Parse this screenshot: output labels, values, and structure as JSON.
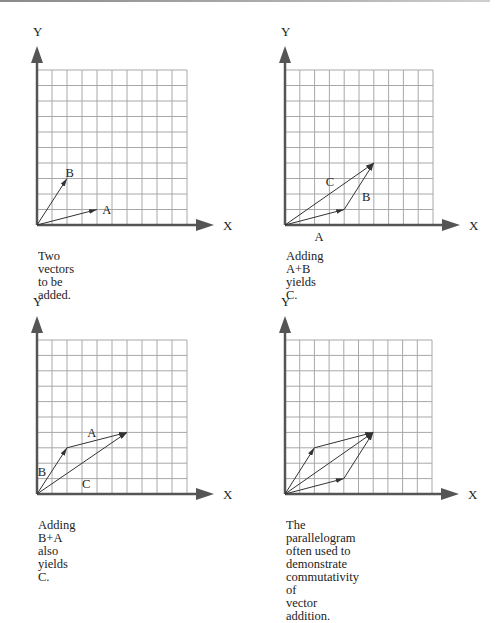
{
  "figure": {
    "grid": {
      "cols": 10,
      "rows": 10
    },
    "colors": {
      "grid": "#a8a8a8",
      "axis": "#555555",
      "vector": "#333333",
      "text": "#222222"
    },
    "axis_labels": {
      "x": "X",
      "y": "Y"
    },
    "panels": [
      {
        "id": "p1",
        "caption": "Two vectors to be added.",
        "vectors": [
          {
            "name": "A",
            "from": [
              0,
              0
            ],
            "to": [
              4,
              1
            ],
            "label": "A",
            "label_pos": [
              4.35,
              1.0
            ]
          },
          {
            "name": "B",
            "from": [
              0,
              0
            ],
            "to": [
              2,
              3
            ],
            "label": "B",
            "label_pos": [
              1.9,
              3.35
            ]
          }
        ]
      },
      {
        "id": "p2",
        "caption": "Adding A+B yields C.",
        "vectors": [
          {
            "name": "A",
            "from": [
              0,
              0
            ],
            "to": [
              4,
              1
            ],
            "label": "A",
            "label_pos": [
              2.0,
              -0.75
            ]
          },
          {
            "name": "B",
            "from": [
              4,
              1
            ],
            "to": [
              6,
              4
            ],
            "label": "B",
            "label_pos": [
              5.2,
              1.8
            ]
          },
          {
            "name": "C",
            "from": [
              0,
              0
            ],
            "to": [
              6,
              4
            ],
            "label": "C",
            "label_pos": [
              2.75,
              2.8
            ]
          }
        ]
      },
      {
        "id": "p3",
        "caption": "Adding B+A also yields C.",
        "vectors": [
          {
            "name": "B",
            "from": [
              0,
              0
            ],
            "to": [
              2,
              3
            ],
            "label": "B",
            "label_pos": [
              0.05,
              1.4
            ]
          },
          {
            "name": "A",
            "from": [
              2,
              3
            ],
            "to": [
              6,
              4
            ],
            "label": "A",
            "label_pos": [
              3.35,
              3.95
            ]
          },
          {
            "name": "C",
            "from": [
              0,
              0
            ],
            "to": [
              6,
              4
            ],
            "label": "C",
            "label_pos": [
              3.0,
              0.65
            ]
          }
        ]
      },
      {
        "id": "p4",
        "caption": "The parallelogram often used to\ndemonstrate commutativity of\nvector addition.",
        "vectors": [
          {
            "name": "A",
            "from": [
              0,
              0
            ],
            "to": [
              4,
              1
            ],
            "label": ""
          },
          {
            "name": "B",
            "from": [
              0,
              0
            ],
            "to": [
              2,
              3
            ],
            "label": ""
          },
          {
            "name": "B2",
            "from": [
              4,
              1
            ],
            "to": [
              6,
              4
            ],
            "label": ""
          },
          {
            "name": "A2",
            "from": [
              2,
              3
            ],
            "to": [
              6,
              4
            ],
            "label": ""
          },
          {
            "name": "C",
            "from": [
              0,
              0
            ],
            "to": [
              6,
              4
            ],
            "label": ""
          }
        ]
      }
    ]
  }
}
